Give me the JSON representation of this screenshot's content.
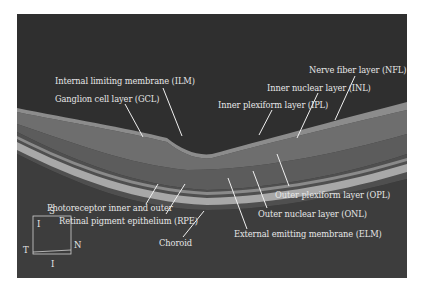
{
  "figure": {
    "colors": {
      "background": "#2e2e2e",
      "vitreous": "#2f2f2f",
      "nfl": "#7a7a7a",
      "retina_mid": "#5a5a5a",
      "rpe": "#b0b0b0",
      "choroid": "#4a4a4a",
      "label_text": "#e6e6e6",
      "leader_line": "#f0f0f0"
    },
    "labels": [
      {
        "id": "ilm",
        "text": "Internal limiting membrane (ILM)"
      },
      {
        "id": "gcl",
        "text": "Ganglion cell layer (GCL)"
      },
      {
        "id": "nfl",
        "text": "Nerve fiber layer (NFL)"
      },
      {
        "id": "inl",
        "text": "Inner nuclear layer (INL)"
      },
      {
        "id": "ipl",
        "text": "Inner plexiform layer (IPL)"
      },
      {
        "id": "photoreceptor",
        "text": "Photoreceptor inner and outer"
      },
      {
        "id": "rpe",
        "text": "Retinal pigment epithelium (RPE)"
      },
      {
        "id": "choroid",
        "text": "Choroid"
      },
      {
        "id": "opl",
        "text": "Outer plexiform layer (OPL)"
      },
      {
        "id": "onl",
        "text": "Outer nuclear layer (ONL)"
      },
      {
        "id": "elm",
        "text": "External emitting membrane (ELM)"
      }
    ],
    "orientation": {
      "superior": "S",
      "inferior_top": "I",
      "temporal": "T",
      "nasal": "N",
      "inferior": "I"
    }
  }
}
